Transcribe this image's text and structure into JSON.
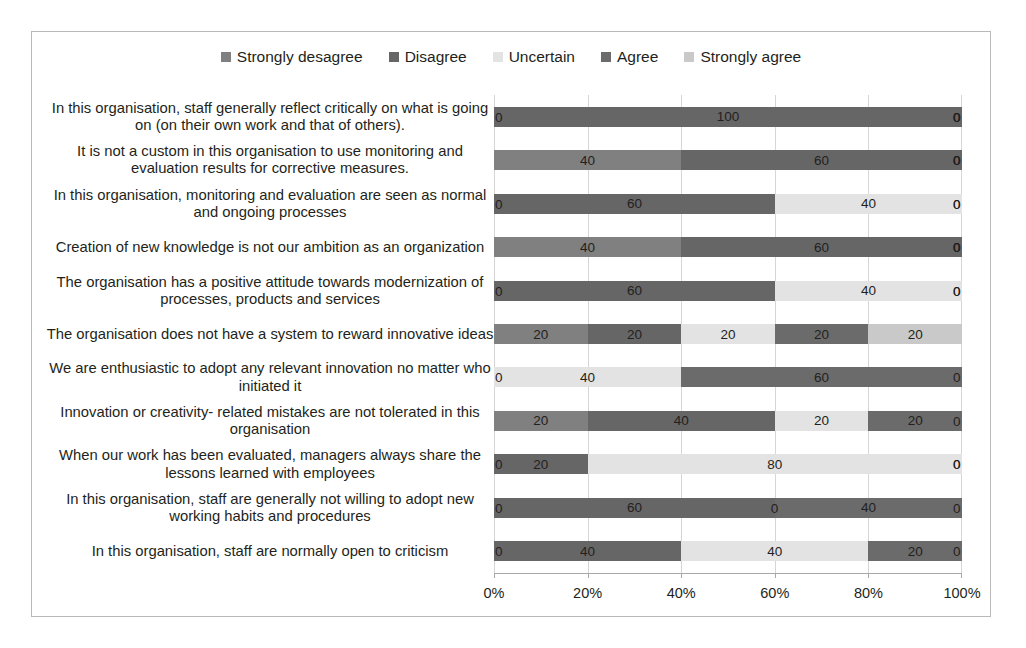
{
  "chart_data": {
    "type": "bar",
    "subtype": "stacked-horizontal-100",
    "title": "",
    "xlabel": "",
    "ylabel": "",
    "xlim": [
      0,
      100
    ],
    "grid": true,
    "legend_position": "top-center",
    "xticks": [
      "0%",
      "20%",
      "40%",
      "60%",
      "80%",
      "100%"
    ],
    "xtick_values": [
      0,
      20,
      40,
      60,
      80,
      100
    ],
    "categories": [
      "In this organisation, staff generally reflect critically on what is going on (on their own work and that of others).",
      "It is not a custom in this organisation to use monitoring and evaluation results for corrective measures.",
      "In this organisation, monitoring and evaluation are seen as normal and ongoing processes",
      "Creation of new knowledge is not our ambition as an organization",
      "The organisation has a positive attitude towards modernization of processes, products and services",
      "The organisation does not have a system to reward innovative ideas",
      "We are enthusiastic to adopt any relevant innovation no matter who initiated it",
      "Innovation or creativity- related mistakes are not tolerated in this organisation",
      "When our work has been evaluated, managers always share the lessons learned with employees",
      "In this organisation, staff are generally not willing to adopt new working habits and procedures",
      "In this organisation, staff are normally open to criticism"
    ],
    "series": [
      {
        "name": "Strongly desagree",
        "color": "#808080",
        "values": [
          0,
          40,
          0,
          40,
          0,
          20,
          0,
          20,
          0,
          0,
          0
        ]
      },
      {
        "name": "Disagree",
        "color": "#666666",
        "values": [
          100,
          60,
          60,
          60,
          60,
          20,
          0,
          40,
          20,
          60,
          40
        ]
      },
      {
        "name": "Uncertain",
        "color": "#e3e3e3",
        "values": [
          0,
          0,
          40,
          0,
          40,
          20,
          40,
          20,
          80,
          0,
          40
        ]
      },
      {
        "name": "Agree",
        "color": "#6b6b6b",
        "values": [
          0,
          0,
          0,
          0,
          0,
          20,
          60,
          20,
          0,
          40,
          20
        ]
      },
      {
        "name": "Strongly agree",
        "color": "#c9c9c9",
        "values": [
          0,
          0,
          0,
          0,
          0,
          20,
          0,
          0,
          0,
          0,
          0
        ]
      }
    ]
  },
  "legend": {
    "items": [
      {
        "label": "Strongly desagree",
        "color": "#808080"
      },
      {
        "label": "Disagree",
        "color": "#666666"
      },
      {
        "label": "Uncertain",
        "color": "#e3e3e3"
      },
      {
        "label": "Agree",
        "color": "#6b6b6b"
      },
      {
        "label": "Strongly agree",
        "color": "#c9c9c9"
      }
    ]
  }
}
